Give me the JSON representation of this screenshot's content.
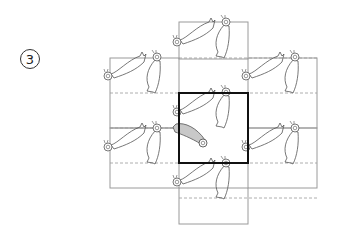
{
  "figure": {
    "step_number": "3",
    "colors": {
      "grid_line": "#9a9a9a",
      "dashed_line": "#9a9a9a",
      "highlight_square": "#111111",
      "bird_outline": "#555555",
      "bird_fill_highlight": "#c8c8c8",
      "badge_stroke": "#333333"
    },
    "grid": {
      "solid_rects": [
        {
          "x": 179,
          "y": 22,
          "w": 69,
          "h": 37
        },
        {
          "x": 110,
          "y": 58,
          "w": 69,
          "h": 70
        },
        {
          "x": 248,
          "y": 58,
          "w": 69,
          "h": 70
        },
        {
          "x": 110,
          "y": 128,
          "w": 69,
          "h": 60
        },
        {
          "x": 248,
          "y": 128,
          "w": 69,
          "h": 60
        },
        {
          "x": 179,
          "y": 188,
          "w": 69,
          "h": 36
        }
      ],
      "highlight_square": {
        "x": 179,
        "y": 93,
        "w": 69,
        "h": 70
      },
      "dashed_lines": [
        {
          "x1": 179,
          "y1": 58,
          "x2": 317,
          "y2": 58
        },
        {
          "x1": 110,
          "y1": 93,
          "x2": 317,
          "y2": 93
        },
        {
          "x1": 110,
          "y1": 128,
          "x2": 179,
          "y2": 128
        },
        {
          "x1": 110,
          "y1": 163,
          "x2": 317,
          "y2": 163
        },
        {
          "x1": 179,
          "y1": 198,
          "x2": 317,
          "y2": 198
        }
      ]
    },
    "birds_horizontal": [
      {
        "x": 108,
        "y": 74
      },
      {
        "x": 177,
        "y": 40
      },
      {
        "x": 246,
        "y": 74
      },
      {
        "x": 177,
        "y": 110
      },
      {
        "x": 108,
        "y": 145
      },
      {
        "x": 246,
        "y": 145
      },
      {
        "x": 177,
        "y": 180
      }
    ],
    "birds_vertical": [
      {
        "x": 157,
        "y": 57
      },
      {
        "x": 226,
        "y": 22
      },
      {
        "x": 295,
        "y": 57
      },
      {
        "x": 226,
        "y": 92
      },
      {
        "x": 157,
        "y": 128
      },
      {
        "x": 295,
        "y": 128
      },
      {
        "x": 226,
        "y": 163
      }
    ],
    "highlighted_bird": {
      "x": 179,
      "y": 128
    }
  }
}
